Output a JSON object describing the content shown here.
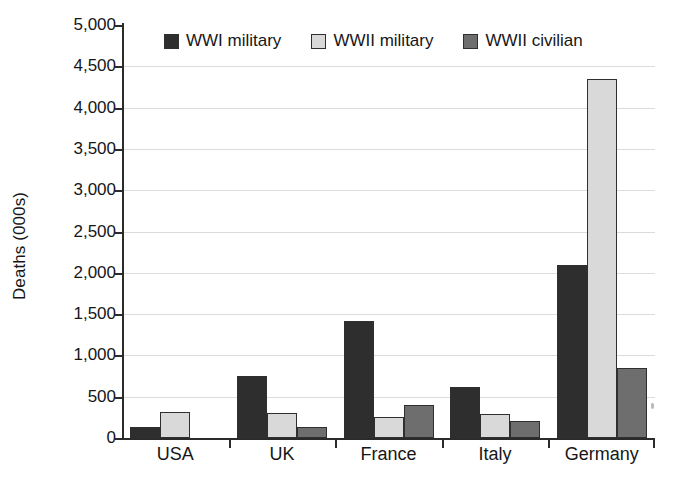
{
  "chart_data": {
    "type": "bar",
    "title": "",
    "xlabel": "",
    "ylabel": "Deaths (000s)",
    "ylim": [
      0,
      5000
    ],
    "ytick_values": [
      5000,
      4500,
      4000,
      3500,
      3000,
      2500,
      2000,
      1500,
      1000,
      500,
      0
    ],
    "ytick_labels": [
      "5,000",
      "4,500",
      "4,000",
      "3,500",
      "3,000",
      "2,500",
      "2,000",
      "1,500",
      "1,000",
      "500",
      "0"
    ],
    "grid": true,
    "legend_position": "top-center",
    "categories": [
      "USA",
      "UK",
      "France",
      "Italy",
      "Germany"
    ],
    "series": [
      {
        "name": "WWI military",
        "color": "#2e2e2e",
        "values": [
          130,
          750,
          1420,
          620,
          2100
        ]
      },
      {
        "name": "WWII military",
        "color": "#d9d9d9",
        "values": [
          320,
          300,
          250,
          290,
          4350
        ]
      },
      {
        "name": "WWII civilian",
        "color": "#6e6e6e",
        "values": [
          0,
          130,
          400,
          200,
          850
        ]
      }
    ]
  },
  "axis": {
    "y_title": "Deaths (000s)",
    "zero_label": "0"
  },
  "legend": {
    "items": [
      {
        "label": "WWI military",
        "color": "#2e2e2e"
      },
      {
        "label": "WWII military",
        "color": "#d9d9d9"
      },
      {
        "label": "WWII civilian",
        "color": "#6e6e6e"
      }
    ]
  }
}
